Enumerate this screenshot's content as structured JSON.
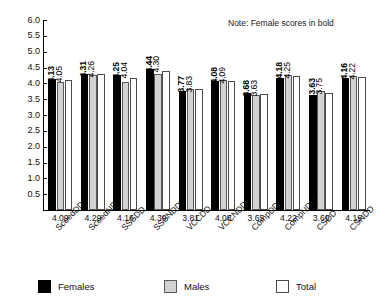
{
  "note": "Note: Female scores in bold",
  "legend": [
    {
      "key": "females",
      "label": "Females",
      "color": "#000000"
    },
    {
      "key": "males",
      "label": "Males",
      "color": "#d2d2d2"
    },
    {
      "key": "total",
      "label": "Total",
      "color": "#ffffff"
    }
  ],
  "chart_data": {
    "type": "bar",
    "title": "",
    "xlabel": "",
    "ylabel": "",
    "ylim": [
      0,
      6.0
    ],
    "yticks": [
      "0.5",
      "1.0",
      "1.5",
      "2.0",
      "2.5",
      "3.0",
      "3.5",
      "4.0",
      "4.5",
      "5.0",
      "5.5",
      "6.0"
    ],
    "grid": false,
    "legend_position": "bottom",
    "annotation": "Note: Female scores in bold",
    "categories": [
      "ScoedDD",
      "ScoedNDD",
      "SSSDD",
      "SSSNDD",
      "VCCDD",
      "VCCNDD",
      "CompDD",
      "CompNDD",
      "CSDD",
      "CSNDD"
    ],
    "series": [
      {
        "name": "Females",
        "color": "#000000",
        "bold_labels": true,
        "values": [
          4.13,
          4.31,
          4.25,
          4.44,
          3.77,
          4.08,
          3.68,
          4.18,
          3.63,
          4.16
        ]
      },
      {
        "name": "Males",
        "color": "#d2d2d2",
        "bold_labels": false,
        "values": [
          4.05,
          4.26,
          4.04,
          4.3,
          3.83,
          4.09,
          3.63,
          4.25,
          3.75,
          4.22
        ]
      },
      {
        "name": "Total",
        "color": "#ffffff",
        "bold_labels": false,
        "values": [
          4.09,
          4.29,
          4.16,
          4.39,
          3.81,
          4.08,
          3.65,
          4.22,
          3.69,
          4.19
        ]
      }
    ],
    "totals_row": [
      "4.09",
      "4.29",
      "4.16",
      "4.39",
      "3.81",
      "4.08",
      "3.65",
      "4.22",
      "3.69",
      "4.19"
    ],
    "value_labels": {
      "females": [
        "4.13",
        "4.31",
        "4.25",
        "4.44",
        "3.77",
        "4.08",
        "3.68",
        "4.18",
        "3.63",
        "4.16"
      ],
      "males": [
        "4.05",
        "4.26",
        "4.04",
        "4.30",
        "3.83",
        "4.09",
        "3.63",
        "4.25",
        "3.75",
        "4.22"
      ]
    }
  }
}
